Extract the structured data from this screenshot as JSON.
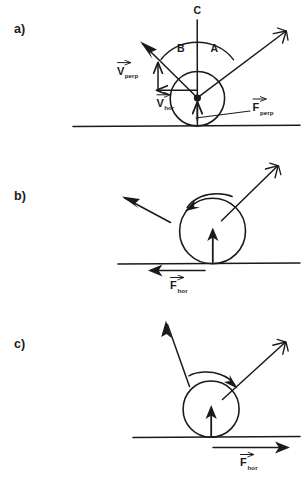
{
  "figure": {
    "background_color": "#ffffff",
    "ink_color": "#1a1a1a",
    "panels": [
      {
        "id": "a",
        "label": "a)",
        "labels": {
          "angle_incoming": "A",
          "angle_outgoing": "B",
          "vertical_line": "C",
          "v_perp_main": "V",
          "v_perp_sub": "perp",
          "v_hor_main": "V",
          "v_hor_sub": "hor",
          "f_perp_main": "F",
          "f_perp_sub": "perp"
        },
        "elements": [
          "ground-line",
          "ball-circle",
          "contact-point-dot",
          "incoming-velocity-arrow",
          "outgoing-velocity-arrow",
          "vertical-normal-line",
          "angle-arc",
          "v-perp-component-arrow",
          "v-hor-component-arrow",
          "f-perp-arrow",
          "f-perp-leader-line"
        ]
      },
      {
        "id": "b",
        "label": "b)",
        "labels": {
          "f_hor_main": "F",
          "f_hor_sub": "hor"
        },
        "spin_direction": "counterclockwise",
        "friction_direction": "left",
        "elements": [
          "ground-line",
          "ball-circle",
          "incoming-velocity-arrow",
          "outgoing-velocity-arrow",
          "spin-arc-arrow",
          "normal-force-arrow",
          "friction-force-arrow"
        ]
      },
      {
        "id": "c",
        "label": "c)",
        "labels": {
          "f_hor_main": "F",
          "f_hor_sub": "hor"
        },
        "spin_direction": "clockwise",
        "friction_direction": "right",
        "elements": [
          "ground-line",
          "ball-circle",
          "incoming-velocity-arrow",
          "outgoing-velocity-arrow",
          "spin-arc-arrow",
          "normal-force-arrow",
          "friction-force-arrow"
        ]
      }
    ]
  }
}
